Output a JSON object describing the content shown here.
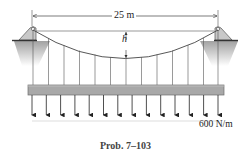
{
  "diagram": {
    "type": "suspension-bridge-cable",
    "span_label": "25 m",
    "sag_label": "h",
    "load_label": "600 N/m",
    "caption": "Prob. 7–103",
    "hanger_count": 13,
    "load_arrow_count": 14,
    "colors": {
      "line": "#555555",
      "deck": "#a8a8a8",
      "deck_edge": "#6e6e6e",
      "support_fill": "#c8c8c8",
      "ground_shade": "#9a9a9a"
    }
  }
}
